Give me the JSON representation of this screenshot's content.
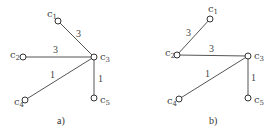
{
  "graphs": [
    {
      "caption": "a)",
      "nodes": [
        {
          "id": "c1",
          "label": "c",
          "sub": "1",
          "x": 58,
          "y": 21
        },
        {
          "id": "c2",
          "label": "c",
          "sub": "2",
          "x": 23,
          "y": 57
        },
        {
          "id": "c3",
          "label": "c",
          "sub": "3",
          "x": 94,
          "y": 57
        },
        {
          "id": "c4",
          "label": "c",
          "sub": "4",
          "x": 25,
          "y": 100
        },
        {
          "id": "c5",
          "label": "c",
          "sub": "5",
          "x": 94,
          "y": 98
        }
      ],
      "edges": [
        {
          "from": "c1",
          "to": "c3",
          "weight": "3"
        },
        {
          "from": "c2",
          "to": "c3",
          "weight": "3"
        },
        {
          "from": "c4",
          "to": "c3",
          "weight": "1"
        },
        {
          "from": "c5",
          "to": "c3",
          "weight": "1"
        }
      ]
    },
    {
      "caption": "b)",
      "nodes": [
        {
          "id": "c1",
          "label": "c",
          "sub": "1",
          "x": 210,
          "y": 19
        },
        {
          "id": "c2",
          "label": "c",
          "sub": "2",
          "x": 177,
          "y": 55
        },
        {
          "id": "c3",
          "label": "c",
          "sub": "3",
          "x": 248,
          "y": 56
        },
        {
          "id": "c4",
          "label": "c",
          "sub": "4",
          "x": 179,
          "y": 99
        },
        {
          "id": "c5",
          "label": "c",
          "sub": "5",
          "x": 248,
          "y": 98
        }
      ],
      "edges": [
        {
          "from": "c1",
          "to": "c2",
          "weight": "3"
        },
        {
          "from": "c2",
          "to": "c3",
          "weight": "3"
        },
        {
          "from": "c4",
          "to": "c3",
          "weight": "1"
        },
        {
          "from": "c5",
          "to": "c3",
          "weight": "1"
        }
      ]
    }
  ]
}
